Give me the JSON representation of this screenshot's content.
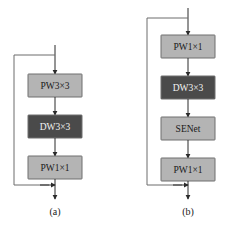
{
  "figure": {
    "background_color": "#ffffff",
    "width": 226,
    "height": 228,
    "colors": {
      "light_block_fill": "#b4b4b4",
      "dark_block_fill": "#4a4a4a",
      "block_stroke": "#6f6f6f",
      "arrow_color": "#2b2b2b",
      "skip_color": "#6d6d6d",
      "light_text": "#1a1a1a",
      "dark_text": "#f2f2f2"
    }
  },
  "panels": [
    {
      "id": "panel-a",
      "caption": "(a)",
      "has_residual_skip": true,
      "blocks": [
        {
          "label": "PW3×3",
          "shade": "light"
        },
        {
          "label": "DW3×3",
          "shade": "dark"
        },
        {
          "label": "PW1×1",
          "shade": "light"
        }
      ]
    },
    {
      "id": "panel-b",
      "caption": "(b)",
      "has_residual_skip": true,
      "blocks": [
        {
          "label": "PW1×1",
          "shade": "light"
        },
        {
          "label": "DW3×3",
          "shade": "dark"
        },
        {
          "label": "SENet",
          "shade": "light"
        },
        {
          "label": "PW1×1",
          "shade": "light"
        }
      ]
    }
  ]
}
